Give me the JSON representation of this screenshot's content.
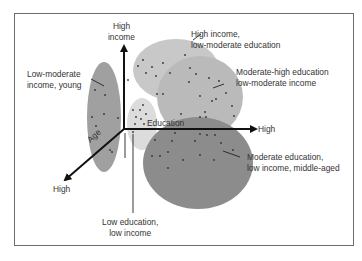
{
  "diagram": {
    "type": "3d-cluster-segmentation",
    "axes": {
      "income": {
        "label_top": "High",
        "label_bottom": "income"
      },
      "education": {
        "label": "Education",
        "end_label": "High"
      },
      "age": {
        "label": "Age",
        "end_label": "High"
      }
    },
    "clusters": [
      {
        "id": "young",
        "label_line1": "Low-moderate",
        "label_line2": "income, young",
        "color": "#a0a0a0"
      },
      {
        "id": "high_income",
        "label_line1": "High income,",
        "label_line2": "low-moderate education",
        "color": "#c8c8c8"
      },
      {
        "id": "mod_high_edu",
        "label_line1": "Moderate-high education",
        "label_line2": "low-moderate income",
        "color": "#bababa"
      },
      {
        "id": "low_edu",
        "label_line1": "Low education,",
        "label_line2": "low income",
        "color": "#dcdcdc"
      },
      {
        "id": "middle_aged",
        "label_line1": "Moderate education,",
        "label_line2": "low income, middle-aged",
        "color": "#8c8c8c"
      }
    ]
  }
}
